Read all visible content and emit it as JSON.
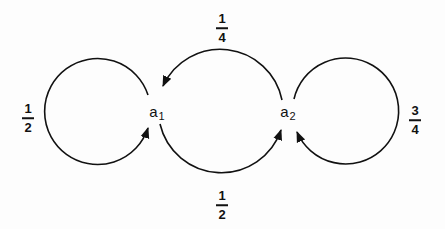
{
  "diagram": {
    "type": "state-transition",
    "stroke_color": "#111111",
    "background_color": "#fdfdfd",
    "nodes": [
      {
        "id": "a1",
        "label": "a",
        "subscript": "1",
        "x": 157,
        "y": 113
      },
      {
        "id": "a2",
        "label": "a",
        "subscript": "2",
        "x": 286,
        "y": 113
      }
    ],
    "edges": [
      {
        "from": "a1",
        "to": "a1",
        "label": {
          "num": "1",
          "den": "2"
        },
        "x": 28,
        "y": 118
      },
      {
        "from": "a2",
        "to": "a1",
        "label": {
          "num": "1",
          "den": "4"
        },
        "x": 222,
        "y": 28
      },
      {
        "from": "a1",
        "to": "a2",
        "label": {
          "num": "1",
          "den": "2"
        },
        "x": 222,
        "y": 205
      },
      {
        "from": "a2",
        "to": "a2",
        "label": {
          "num": "3",
          "den": "4"
        },
        "x": 415,
        "y": 120
      }
    ]
  }
}
